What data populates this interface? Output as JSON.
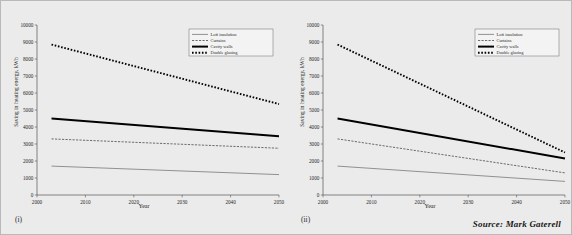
{
  "figure": {
    "source_credit": "Source: Mark Gaterell",
    "background_color": "#ebebeb",
    "frame_border_color": "#b9b9b9"
  },
  "panels": [
    {
      "subfigure_label": "(i)",
      "xlabel": "Year",
      "ylabel": "Saving in heating energy, kWh"
    },
    {
      "subfigure_label": "(ii)",
      "xlabel": "Year",
      "ylabel": "Saving in heating energy, kWh"
    }
  ],
  "legend": {
    "items": [
      {
        "label": "Loft insulation",
        "style": "solid-thin",
        "color": "#808080"
      },
      {
        "label": "Curtains",
        "style": "dashed-thin",
        "color": "#4a4a4a"
      },
      {
        "label": "Cavity walls",
        "style": "solid-thick",
        "color": "#000000"
      },
      {
        "label": "Double glazing",
        "style": "dotted-thick",
        "color": "#000000"
      }
    ]
  },
  "chart_data": [
    {
      "type": "line",
      "title": "",
      "subfigure": "(i)",
      "xlabel": "Year",
      "ylabel": "Saving in heating energy, kWh",
      "xlim": [
        2000,
        2050
      ],
      "ylim": [
        0,
        10000
      ],
      "xticks": [
        2000,
        2010,
        2020,
        2030,
        2040,
        2050
      ],
      "yticks": [
        0,
        1000,
        2000,
        3000,
        4000,
        5000,
        6000,
        7000,
        8000,
        9000,
        10000
      ],
      "grid": false,
      "legend_position": "top-right",
      "x": [
        2003,
        2050
      ],
      "series": [
        {
          "name": "Double glazing",
          "values": [
            8850,
            5350
          ]
        },
        {
          "name": "Cavity walls",
          "values": [
            4500,
            3450
          ]
        },
        {
          "name": "Curtains",
          "values": [
            3300,
            2750
          ]
        },
        {
          "name": "Loft insulation",
          "values": [
            1700,
            1200
          ]
        }
      ]
    },
    {
      "type": "line",
      "title": "",
      "subfigure": "(ii)",
      "xlabel": "Year",
      "ylabel": "Saving in heating energy, kWh",
      "xlim": [
        2000,
        2050
      ],
      "ylim": [
        0,
        10000
      ],
      "xticks": [
        2000,
        2010,
        2020,
        2030,
        2040,
        2050
      ],
      "yticks": [
        0,
        1000,
        2000,
        3000,
        4000,
        5000,
        6000,
        7000,
        8000,
        9000,
        10000
      ],
      "grid": false,
      "legend_position": "top-right",
      "x": [
        2003,
        2050
      ],
      "series": [
        {
          "name": "Double glazing",
          "values": [
            8850,
            2500
          ]
        },
        {
          "name": "Cavity walls",
          "values": [
            4500,
            2150
          ]
        },
        {
          "name": "Curtains",
          "values": [
            3300,
            1300
          ]
        },
        {
          "name": "Loft insulation",
          "values": [
            1700,
            800
          ]
        }
      ]
    }
  ]
}
